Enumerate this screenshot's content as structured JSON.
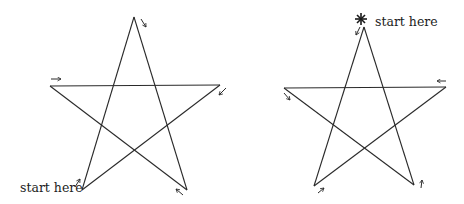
{
  "diagrams": [
    {
      "id": "left",
      "label": "start here",
      "vertices": {
        "apex": [
          134,
          17
        ],
        "left": [
          50,
          86
        ],
        "right": [
          220,
          85
        ],
        "bottom_left": [
          82,
          190
        ],
        "bottom_right": [
          187,
          190
        ]
      },
      "start_vertex": "bottom_left",
      "arrows": [
        {
          "at": "apex",
          "direction": "down-right",
          "glyph": "↘"
        },
        {
          "at": "left",
          "direction": "right",
          "glyph": "→"
        },
        {
          "at": "right",
          "direction": "down-left",
          "glyph": "↙"
        },
        {
          "at": "bottom_left",
          "direction": "up-right",
          "glyph": "↗"
        },
        {
          "at": "bottom_right",
          "direction": "up-left",
          "glyph": "↖"
        }
      ]
    },
    {
      "id": "right",
      "label": "start here",
      "start_marker": "asterisk",
      "vertices": {
        "apex": [
          364,
          27
        ],
        "left": [
          284,
          88
        ],
        "right": [
          446,
          87
        ],
        "bottom_left": [
          314,
          186
        ],
        "bottom_right": [
          414,
          185
        ]
      },
      "start_vertex": "apex",
      "arrows": [
        {
          "at": "apex",
          "direction": "down-left",
          "glyph": "↙"
        },
        {
          "at": "left",
          "direction": "down-right",
          "glyph": "↘"
        },
        {
          "at": "right",
          "direction": "left",
          "glyph": "←"
        },
        {
          "at": "bottom_left",
          "direction": "up-right",
          "glyph": "↗"
        },
        {
          "at": "bottom_right",
          "direction": "up",
          "glyph": "↑"
        }
      ]
    }
  ],
  "colors": {
    "stroke": "#2a2a2a",
    "background": "#ffffff"
  }
}
